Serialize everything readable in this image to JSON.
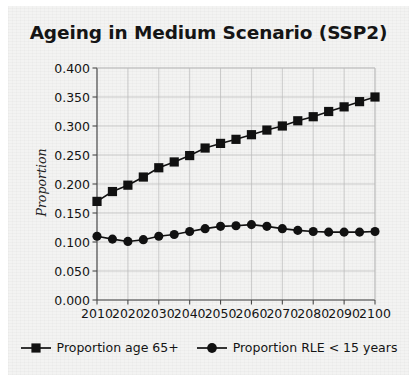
{
  "chart_data": {
    "type": "line",
    "title": "Ageing in Medium Scenario (SSP2)",
    "xlabel": "",
    "ylabel": "Proportion",
    "xlim": [
      2010,
      2100
    ],
    "ylim": [
      0.0,
      0.4
    ],
    "grid": true,
    "legend_position": "bottom",
    "x": [
      2010,
      2015,
      2020,
      2025,
      2030,
      2035,
      2040,
      2045,
      2050,
      2055,
      2060,
      2065,
      2070,
      2075,
      2080,
      2085,
      2090,
      2095,
      2100
    ],
    "xticks": [
      "2010",
      "2020",
      "2030",
      "2040",
      "2050",
      "2060",
      "2070",
      "2080",
      "2090",
      "2100"
    ],
    "xtick_values": [
      2010,
      2020,
      2030,
      2040,
      2050,
      2060,
      2070,
      2080,
      2090,
      2100
    ],
    "yticks": [
      "0.000",
      "0.050",
      "0.100",
      "0.150",
      "0.200",
      "0.250",
      "0.300",
      "0.350",
      "0.400"
    ],
    "ytick_values": [
      0.0,
      0.05,
      0.1,
      0.15,
      0.2,
      0.25,
      0.3,
      0.35,
      0.4
    ],
    "series": [
      {
        "name": "Proportion age 65+",
        "marker": "square",
        "color": "#111111",
        "values": [
          0.17,
          0.187,
          0.198,
          0.212,
          0.228,
          0.238,
          0.249,
          0.262,
          0.27,
          0.277,
          0.285,
          0.293,
          0.3,
          0.309,
          0.316,
          0.325,
          0.333,
          0.342,
          0.35
        ]
      },
      {
        "name": "Proportion RLE < 15 years",
        "marker": "circle",
        "color": "#111111",
        "values": [
          0.11,
          0.105,
          0.101,
          0.104,
          0.11,
          0.113,
          0.118,
          0.123,
          0.127,
          0.128,
          0.13,
          0.127,
          0.123,
          0.12,
          0.118,
          0.117,
          0.117,
          0.117,
          0.118
        ]
      }
    ]
  },
  "legend": {
    "items": [
      {
        "label": "Proportion age 65+",
        "marker": "square"
      },
      {
        "label": "Proportion RLE < 15 years",
        "marker": "circle"
      }
    ]
  }
}
